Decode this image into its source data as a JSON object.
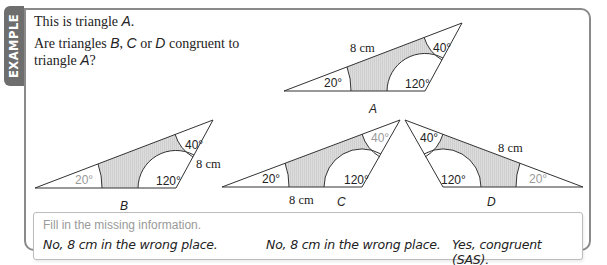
{
  "tab": {
    "label": "EXAMPLE"
  },
  "question": {
    "line1_prefix": "This is triangle ",
    "line1_var": "A",
    "line1_suffix": ".",
    "line2_prefix": "Are triangles ",
    "line2_b": "B",
    "line2_sep1": ", ",
    "line2_c": "C",
    "line2_or": " or ",
    "line2_d": "D",
    "line2_suffix": " congruent to",
    "line3_prefix": "triangle ",
    "line3_var": "A",
    "line3_suffix": "?"
  },
  "triangles": {
    "A": {
      "label": "A",
      "angle_left": "20°",
      "angle_top": "40°",
      "angle_obtuse": "120°",
      "side": "8 cm",
      "greyed": ""
    },
    "B": {
      "label": "B",
      "angle_left": "20°",
      "angle_top": "40°",
      "angle_obtuse": "120°",
      "side": "8 cm",
      "greyed": "20°"
    },
    "C": {
      "label": "C",
      "angle_left": "20°",
      "angle_top": "40°",
      "angle_obtuse": "120°",
      "side": "8 cm",
      "greyed": "40°"
    },
    "D": {
      "label": "D",
      "angle_left": "20°",
      "angle_top": "40°",
      "angle_obtuse": "120°",
      "side": "8 cm",
      "greyed": "20°"
    }
  },
  "colors": {
    "frame": "#8a8a8a",
    "tab": "#6e6e6e",
    "shade": "#d9d9d9",
    "grey_text": "#9a9a9a"
  },
  "fill": {
    "prompt": "Fill in the missing information.",
    "answers": [
      "No, 8 cm in the wrong place.",
      "No, 8 cm in the wrong place.",
      "Yes, congruent (SAS)."
    ]
  }
}
